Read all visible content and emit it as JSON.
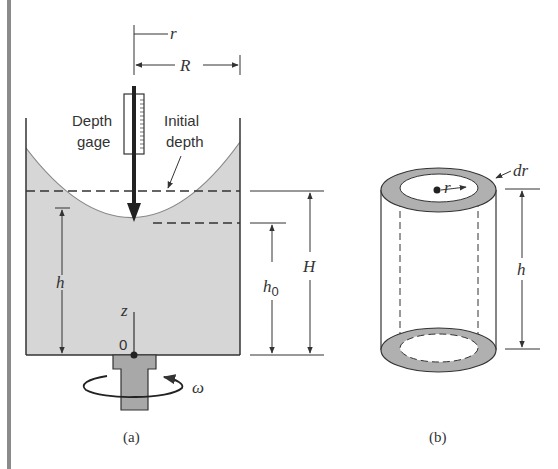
{
  "figure_a": {
    "caption": "(a)",
    "labels": {
      "r": "r",
      "R": "R",
      "depth_gage_line1": "Depth",
      "depth_gage_line2": "gage",
      "initial_depth_line1": "Initial",
      "initial_depth_line2": "depth",
      "h": "h",
      "h0_base": "h",
      "h0_sub": "0",
      "H": "H",
      "z": "z",
      "origin": "0",
      "omega": "ω"
    }
  },
  "figure_b": {
    "caption": "(b)",
    "labels": {
      "dr": "dr",
      "r": "r",
      "h": "h"
    }
  },
  "colors": {
    "fluid_fill": "#d6d6d6",
    "stroke": "#333333",
    "left_bar": "#8a8a8a",
    "base_fill": "#a8a8a8",
    "annulus_fill": "#b0b0b0"
  }
}
